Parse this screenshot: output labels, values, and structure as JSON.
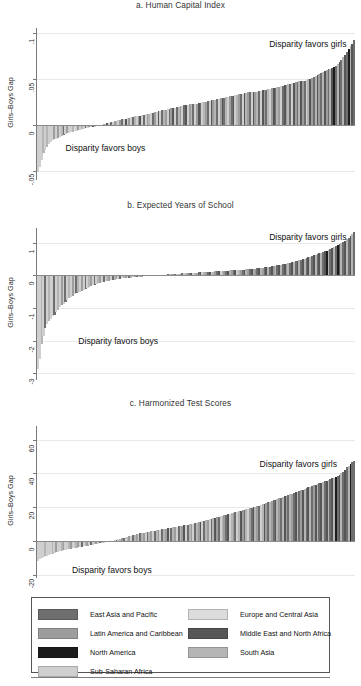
{
  "figure": {
    "width": 361,
    "height": 686,
    "annotation_girls": "Disparity favors girls",
    "annotation_boys": "Disparity favors boys",
    "y_axis_title": "Girls–Boys Gap"
  },
  "legend": {
    "columns": [
      [
        {
          "label": "East Asia and Pacific",
          "color": "#6e6e6e"
        },
        {
          "label": "Latin America and Caribbean",
          "color": "#9d9d9d"
        },
        {
          "label": "North America",
          "color": "#1c1c1c"
        },
        {
          "label": "Sub-Saharan Africa",
          "color": "#cfcfcf"
        }
      ],
      [
        {
          "label": "Europe and Central Asia",
          "color": "#dcdcdc"
        },
        {
          "label": "Middle East and North Africa",
          "color": "#565656"
        },
        {
          "label": "South Asia",
          "color": "#b5b5b5"
        }
      ]
    ]
  },
  "chart_data": [
    {
      "type": "bar",
      "panel": "a",
      "title": "a. Human Capital Index",
      "xlabel": "",
      "ylabel": "Girls–Boys Gap",
      "ylim": [
        -0.06,
        0.105
      ],
      "yticks": [
        0.1,
        0.05,
        0,
        -0.05
      ],
      "ytick_labels": [
        ".1",
        ".05",
        "0",
        "-.05"
      ],
      "grid": true,
      "zero_reference": 0,
      "annotations": [
        {
          "text": "Disparity favors girls",
          "x_frac": 0.73,
          "y": 0.087
        },
        {
          "text": "Disparity favors boys",
          "x_frac": 0.09,
          "y": -0.026
        }
      ],
      "n_bars": 174,
      "values": [
        -0.051,
        -0.046,
        -0.038,
        -0.031,
        -0.027,
        -0.024,
        -0.021,
        -0.019,
        -0.017,
        -0.016,
        -0.015,
        -0.014,
        -0.013,
        -0.012,
        -0.011,
        -0.01,
        -0.009,
        -0.009,
        -0.008,
        -0.008,
        -0.007,
        -0.007,
        -0.006,
        -0.006,
        -0.005,
        -0.005,
        -0.004,
        -0.004,
        -0.003,
        -0.003,
        -0.002,
        -0.002,
        -0.001,
        -0.001,
        0.0,
        0.0,
        0.001,
        0.001,
        0.002,
        0.002,
        0.003,
        0.003,
        0.004,
        0.004,
        0.005,
        0.005,
        0.006,
        0.006,
        0.006,
        0.007,
        0.007,
        0.008,
        0.008,
        0.009,
        0.009,
        0.01,
        0.01,
        0.011,
        0.011,
        0.012,
        0.012,
        0.012,
        0.013,
        0.013,
        0.014,
        0.014,
        0.015,
        0.015,
        0.016,
        0.016,
        0.016,
        0.017,
        0.017,
        0.018,
        0.018,
        0.018,
        0.019,
        0.019,
        0.02,
        0.02,
        0.021,
        0.021,
        0.021,
        0.022,
        0.022,
        0.023,
        0.023,
        0.023,
        0.024,
        0.024,
        0.025,
        0.025,
        0.025,
        0.026,
        0.026,
        0.027,
        0.027,
        0.027,
        0.028,
        0.028,
        0.029,
        0.029,
        0.029,
        0.03,
        0.03,
        0.031,
        0.031,
        0.031,
        0.032,
        0.032,
        0.033,
        0.033,
        0.033,
        0.034,
        0.034,
        0.035,
        0.035,
        0.035,
        0.036,
        0.036,
        0.036,
        0.037,
        0.037,
        0.038,
        0.038,
        0.038,
        0.039,
        0.039,
        0.04,
        0.04,
        0.04,
        0.041,
        0.041,
        0.042,
        0.042,
        0.043,
        0.043,
        0.044,
        0.044,
        0.045,
        0.045,
        0.046,
        0.046,
        0.047,
        0.047,
        0.048,
        0.048,
        0.049,
        0.05,
        0.05,
        0.051,
        0.052,
        0.053,
        0.054,
        0.055,
        0.056,
        0.057,
        0.058,
        0.059,
        0.06,
        0.061,
        0.062,
        0.063,
        0.064,
        0.066,
        0.068,
        0.07,
        0.073,
        0.076,
        0.079,
        0.082,
        0.085,
        0.088,
        0.092
      ],
      "group_indices": [
        3,
        3,
        3,
        6,
        3,
        6,
        3,
        3,
        3,
        1,
        3,
        1,
        3,
        6,
        0,
        3,
        1,
        3,
        3,
        6,
        4,
        3,
        1,
        3,
        6,
        3,
        0,
        3,
        1,
        3,
        5,
        3,
        1,
        0,
        3,
        6,
        1,
        3,
        5,
        3,
        0,
        3,
        1,
        6,
        3,
        1,
        0,
        3,
        5,
        3,
        1,
        3,
        0,
        6,
        3,
        1,
        5,
        3,
        0,
        3,
        1,
        6,
        3,
        0,
        1,
        3,
        5,
        3,
        0,
        6,
        1,
        3,
        0,
        1,
        5,
        3,
        0,
        6,
        1,
        3,
        0,
        5,
        3,
        1,
        6,
        0,
        3,
        1,
        5,
        0,
        3,
        6,
        1,
        0,
        3,
        5,
        1,
        6,
        0,
        3,
        1,
        5,
        0,
        6,
        3,
        1,
        0,
        5,
        3,
        6,
        1,
        0,
        3,
        5,
        6,
        1,
        0,
        3,
        5,
        1,
        6,
        0,
        3,
        5,
        1,
        0,
        6,
        3,
        1,
        5,
        0,
        6,
        1,
        3,
        0,
        5,
        1,
        6,
        0,
        3,
        5,
        1,
        0,
        6,
        5,
        1,
        0,
        3,
        6,
        5,
        1,
        0,
        6,
        5,
        1,
        0,
        6,
        5,
        1,
        0,
        6,
        5,
        2,
        0,
        6,
        5,
        0,
        6,
        5,
        0,
        2,
        6,
        5,
        0
      ]
    },
    {
      "type": "bar",
      "panel": "b",
      "title": "b. Expected Years of School",
      "xlabel": "",
      "ylabel": "Girls–Boys Gap",
      "ylim": [
        -3.2,
        1.45
      ],
      "yticks": [
        1,
        0,
        -1,
        -2,
        -3
      ],
      "ytick_labels": [
        "1",
        "0",
        "-1",
        "-2",
        "-3"
      ],
      "grid": true,
      "zero_reference": 0,
      "annotations": [
        {
          "text": "Disparity favors girls",
          "x_frac": 0.73,
          "y": 1.15
        },
        {
          "text": "Disparity favors boys",
          "x_frac": 0.13,
          "y": -2.05
        }
      ],
      "n_bars": 174,
      "values": [
        -2.85,
        -2.55,
        -2.1,
        -1.85,
        -1.62,
        -1.48,
        -1.4,
        -1.32,
        -1.25,
        -1.2,
        -1.12,
        -1.05,
        -0.98,
        -0.92,
        -0.86,
        -0.8,
        -0.74,
        -0.7,
        -0.66,
        -0.62,
        -0.58,
        -0.55,
        -0.52,
        -0.5,
        -0.47,
        -0.44,
        -0.41,
        -0.38,
        -0.35,
        -0.32,
        -0.3,
        -0.28,
        -0.26,
        -0.24,
        -0.22,
        -0.2,
        -0.19,
        -0.18,
        -0.17,
        -0.16,
        -0.15,
        -0.14,
        -0.13,
        -0.12,
        -0.11,
        -0.1,
        -0.09,
        -0.09,
        -0.08,
        -0.08,
        -0.07,
        -0.07,
        -0.06,
        -0.06,
        -0.05,
        -0.05,
        -0.04,
        -0.04,
        -0.03,
        -0.03,
        -0.02,
        -0.02,
        -0.01,
        -0.01,
        0.0,
        0.0,
        0.01,
        0.01,
        0.02,
        0.02,
        0.02,
        0.03,
        0.03,
        0.04,
        0.04,
        0.04,
        0.05,
        0.05,
        0.05,
        0.06,
        0.06,
        0.06,
        0.07,
        0.07,
        0.07,
        0.08,
        0.08,
        0.08,
        0.09,
        0.09,
        0.09,
        0.1,
        0.1,
        0.1,
        0.11,
        0.11,
        0.11,
        0.12,
        0.12,
        0.12,
        0.13,
        0.13,
        0.13,
        0.14,
        0.14,
        0.15,
        0.15,
        0.15,
        0.16,
        0.16,
        0.17,
        0.17,
        0.18,
        0.18,
        0.19,
        0.19,
        0.2,
        0.2,
        0.21,
        0.21,
        0.22,
        0.23,
        0.23,
        0.24,
        0.25,
        0.25,
        0.26,
        0.27,
        0.28,
        0.29,
        0.3,
        0.31,
        0.32,
        0.33,
        0.34,
        0.35,
        0.36,
        0.38,
        0.39,
        0.4,
        0.42,
        0.43,
        0.45,
        0.46,
        0.48,
        0.5,
        0.51,
        0.53,
        0.55,
        0.57,
        0.59,
        0.61,
        0.63,
        0.65,
        0.67,
        0.69,
        0.71,
        0.74,
        0.76,
        0.79,
        0.81,
        0.84,
        0.87,
        0.9,
        0.93,
        0.96,
        0.99,
        1.02,
        1.06,
        1.1,
        1.15,
        1.2,
        1.26,
        1.33
      ],
      "group_indices": [
        3,
        3,
        6,
        3,
        0,
        3,
        6,
        3,
        3,
        0,
        3,
        6,
        3,
        1,
        3,
        0,
        3,
        6,
        3,
        1,
        3,
        0,
        6,
        3,
        1,
        3,
        0,
        3,
        6,
        1,
        3,
        0,
        3,
        6,
        1,
        3,
        0,
        3,
        6,
        1,
        3,
        0,
        6,
        1,
        3,
        0,
        3,
        6,
        1,
        3,
        0,
        6,
        3,
        1,
        0,
        3,
        6,
        1,
        3,
        0,
        6,
        1,
        3,
        0,
        3,
        6,
        1,
        0,
        3,
        6,
        1,
        0,
        3,
        6,
        1,
        0,
        3,
        6,
        1,
        0,
        3,
        6,
        1,
        0,
        5,
        3,
        6,
        1,
        0,
        5,
        3,
        6,
        1,
        0,
        5,
        3,
        6,
        1,
        0,
        5,
        3,
        6,
        1,
        0,
        5,
        6,
        1,
        0,
        5,
        3,
        6,
        1,
        0,
        5,
        6,
        1,
        0,
        5,
        6,
        1,
        0,
        5,
        6,
        1,
        0,
        5,
        6,
        0,
        5,
        1,
        6,
        0,
        5,
        6,
        0,
        5,
        1,
        6,
        0,
        5,
        6,
        0,
        5,
        6,
        0,
        5,
        6,
        0,
        5,
        6,
        0,
        5,
        6,
        0,
        5,
        6,
        0,
        5,
        2,
        6,
        0,
        5,
        6,
        0,
        2,
        5,
        6,
        0,
        5,
        6,
        0,
        5,
        6,
        0
      ]
    },
    {
      "type": "bar",
      "panel": "c",
      "title": "c. Harmonized Test Scores",
      "xlabel": "",
      "ylabel": "Girls–Boys Gap",
      "ylim": [
        -22,
        68
      ],
      "yticks": [
        60,
        40,
        20,
        0,
        -20
      ],
      "ytick_labels": [
        "60",
        "40",
        "20",
        "0",
        "-20"
      ],
      "grid": true,
      "zero_reference": 0,
      "annotations": [
        {
          "text": "Disparity favors girls",
          "x_frac": 0.7,
          "y": 45
        },
        {
          "text": "Disparity favors boys",
          "x_frac": 0.11,
          "y": -18
        }
      ],
      "n_bars": 174,
      "values": [
        -11.8,
        -11.0,
        -10.4,
        -9.8,
        -9.2,
        -8.8,
        -8.3,
        -7.9,
        -7.5,
        -7.1,
        -6.8,
        -6.5,
        -6.2,
        -5.9,
        -5.6,
        -5.3,
        -5.0,
        -4.8,
        -4.6,
        -4.4,
        -4.2,
        -4.0,
        -3.8,
        -3.6,
        -3.4,
        -3.2,
        -3.0,
        -2.8,
        -2.6,
        -2.4,
        -2.2,
        -2.0,
        -1.8,
        -1.6,
        -1.4,
        -1.2,
        -1.0,
        -0.8,
        -0.6,
        -0.4,
        -0.2,
        0.0,
        0.3,
        0.6,
        0.9,
        1.2,
        1.5,
        1.8,
        2.1,
        2.4,
        2.7,
        3.0,
        3.3,
        3.6,
        3.9,
        4.2,
        4.4,
        4.6,
        4.8,
        5.0,
        5.2,
        5.4,
        5.6,
        5.8,
        6.0,
        6.2,
        6.4,
        6.6,
        6.8,
        7.0,
        7.2,
        7.4,
        7.6,
        7.8,
        8.0,
        8.2,
        8.4,
        8.6,
        8.8,
        9.0,
        9.2,
        9.4,
        9.6,
        9.8,
        10.0,
        10.2,
        10.5,
        10.8,
        11.0,
        11.3,
        11.6,
        11.9,
        12.2,
        12.5,
        12.8,
        13.1,
        13.4,
        13.7,
        14.0,
        14.3,
        14.6,
        14.9,
        15.2,
        15.5,
        15.8,
        16.1,
        16.4,
        16.7,
        17.0,
        17.3,
        17.6,
        17.9,
        18.2,
        18.5,
        18.8,
        19.1,
        19.4,
        19.7,
        20.0,
        20.3,
        20.6,
        20.9,
        21.2,
        21.6,
        22.0,
        22.4,
        22.8,
        23.2,
        23.6,
        24.0,
        24.4,
        24.8,
        25.2,
        25.6,
        26.0,
        26.4,
        26.8,
        27.2,
        27.6,
        28.0,
        28.4,
        28.8,
        29.2,
        29.6,
        30.0,
        30.4,
        30.8,
        31.2,
        31.6,
        32.0,
        32.4,
        32.8,
        33.2,
        33.6,
        34.0,
        34.4,
        34.8,
        35.2,
        35.6,
        36.0,
        36.5,
        37.0,
        37.5,
        38.0,
        38.5,
        39.0,
        40.0,
        41.0,
        42.0,
        43.5,
        44.5,
        45.5,
        46.5,
        47.5
      ],
      "group_indices": [
        3,
        3,
        3,
        3,
        6,
        3,
        3,
        3,
        6,
        3,
        1,
        3,
        3,
        6,
        1,
        3,
        3,
        6,
        1,
        3,
        3,
        6,
        1,
        3,
        0,
        3,
        6,
        1,
        3,
        0,
        3,
        6,
        1,
        3,
        0,
        6,
        3,
        1,
        0,
        3,
        6,
        1,
        3,
        0,
        3,
        6,
        1,
        0,
        3,
        6,
        1,
        3,
        0,
        6,
        1,
        3,
        0,
        6,
        1,
        3,
        0,
        6,
        1,
        3,
        0,
        6,
        1,
        3,
        0,
        6,
        1,
        5,
        3,
        0,
        6,
        1,
        3,
        0,
        6,
        1,
        5,
        3,
        0,
        6,
        1,
        3,
        0,
        6,
        1,
        5,
        3,
        0,
        6,
        1,
        3,
        0,
        6,
        5,
        1,
        0,
        3,
        6,
        1,
        0,
        5,
        3,
        6,
        1,
        0,
        3,
        6,
        5,
        1,
        0,
        6,
        3,
        1,
        0,
        5,
        6,
        1,
        0,
        3,
        6,
        5,
        1,
        0,
        6,
        1,
        0,
        5,
        6,
        1,
        0,
        6,
        5,
        1,
        0,
        6,
        1,
        0,
        5,
        6,
        0,
        1,
        5,
        6,
        0,
        5,
        6,
        0,
        1,
        5,
        6,
        0,
        5,
        6,
        0,
        5,
        6,
        0,
        5,
        6,
        2,
        0,
        5,
        6,
        0,
        5,
        0,
        6,
        2,
        0,
        0
      ]
    }
  ]
}
